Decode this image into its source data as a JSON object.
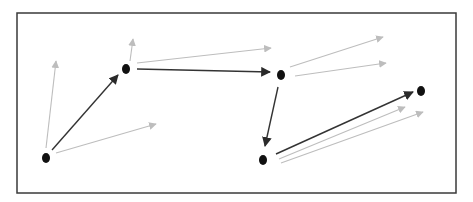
{
  "diagram": {
    "type": "graph-path",
    "colors": {
      "frame": "#3a3a3a",
      "node": "#111111",
      "chosen_edge": "#333333",
      "candidate_edge": "#bdbdbd"
    },
    "frame": {
      "x": 17,
      "y": 13,
      "width": 439,
      "height": 180
    },
    "nodes": [
      {
        "id": "n1",
        "x": 46,
        "y": 158
      },
      {
        "id": "n2",
        "x": 126,
        "y": 69
      },
      {
        "id": "n3",
        "x": 281,
        "y": 75
      },
      {
        "id": "n4",
        "x": 263,
        "y": 160
      },
      {
        "id": "n5",
        "x": 421,
        "y": 91
      }
    ],
    "chosen_edges": [
      {
        "from": [
          52,
          150
        ],
        "to": [
          118,
          75
        ]
      },
      {
        "from": [
          137,
          69
        ],
        "to": [
          270,
          72
        ]
      },
      {
        "from": [
          278,
          87
        ],
        "to": [
          265,
          146
        ]
      },
      {
        "from": [
          276,
          154
        ],
        "to": [
          413,
          92
        ]
      }
    ],
    "candidate_edges": [
      {
        "from": [
          46,
          148
        ],
        "to": [
          56,
          61
        ]
      },
      {
        "from": [
          56,
          153
        ],
        "to": [
          156,
          124
        ]
      },
      {
        "from": [
          130,
          61
        ],
        "to": [
          133,
          39
        ]
      },
      {
        "from": [
          137,
          63
        ],
        "to": [
          271,
          48
        ]
      },
      {
        "from": [
          290,
          67
        ],
        "to": [
          383,
          37
        ]
      },
      {
        "from": [
          295,
          76
        ],
        "to": [
          386,
          63
        ]
      },
      {
        "from": [
          279,
          159
        ],
        "to": [
          405,
          107
        ]
      },
      {
        "from": [
          281,
          163
        ],
        "to": [
          423,
          112
        ]
      }
    ]
  }
}
